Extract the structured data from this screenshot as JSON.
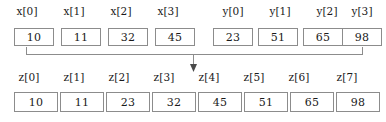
{
  "figure": {
    "kind": "array-merge-diagram",
    "colors": {
      "background": "#ffffff",
      "box_border": "#8c8c8c",
      "connector_line": "#8c8c8c",
      "arrow_head": "#4a4a4a",
      "text": "#1a1a1a"
    }
  },
  "arrays": {
    "x": {
      "name": "x",
      "labels": [
        "x[0]",
        "x[1]",
        "x[2]",
        "x[3]"
      ],
      "values": [
        10,
        11,
        32,
        45
      ]
    },
    "y": {
      "name": "y",
      "labels": [
        "y[0]",
        "y[1]",
        "y[2]",
        "y[3]"
      ],
      "values": [
        23,
        51,
        65,
        98
      ]
    },
    "z": {
      "name": "z",
      "labels": [
        "z[0]",
        "z[1]",
        "z[2]",
        "z[3]",
        "z[4]",
        "z[5]",
        "z[6]",
        "z[7]"
      ],
      "values": [
        10,
        11,
        23,
        32,
        45,
        51,
        65,
        98
      ]
    }
  },
  "connector": {
    "arrow_direction": "down",
    "arrow_label": ""
  }
}
